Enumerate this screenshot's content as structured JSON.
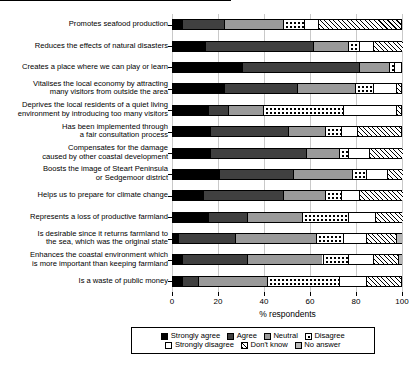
{
  "chart_data": {
    "type": "bar",
    "orientation": "horizontal",
    "stacked": true,
    "title": "",
    "xlabel": "% respondents",
    "ylabel": "",
    "xlim": [
      0,
      100
    ],
    "xticks": [
      0,
      20,
      40,
      60,
      80,
      100
    ],
    "grid": true,
    "legend_position": "bottom",
    "categories": [
      "Promotes seafood production",
      "Reduces the effects of natural disasters",
      "Creates a place where we can play or learn",
      "Vitalises the local economy by attracting\nmany visitors from outside the area",
      "Deprives the local residents of a quiet living\nenvironment by introducing too many visitors",
      "Has been implemented through\na fair consultation process",
      "Compensates for the damage\ncaused by other coastal development",
      "Boosts the image of Steart Peninsula\nor Sedgemoor district",
      "Helps us to prepare for climate change",
      "Represents a loss of productive farmland",
      "Is desirable since it returns farmland to\nthe sea, which was the original state",
      "Enhances the coastal environment which\nis more important than keeping farmland",
      "Is a waste of public money"
    ],
    "series": [
      {
        "name": "Strongly agree",
        "key": "strongly-agree",
        "values": [
          4,
          14,
          30,
          22,
          15,
          16,
          16,
          20,
          13,
          15,
          2,
          4,
          4
        ]
      },
      {
        "name": "Agree",
        "key": "agree",
        "values": [
          18,
          47,
          51,
          32,
          9,
          34,
          42,
          32,
          35,
          17,
          25,
          28,
          7
        ]
      },
      {
        "name": "Neutral",
        "key": "neutral",
        "values": [
          26,
          15,
          13,
          25,
          15,
          16,
          14,
          26,
          18,
          24,
          35,
          33,
          30
        ]
      },
      {
        "name": "Disagree",
        "key": "disagree",
        "values": [
          9,
          5,
          2,
          8,
          35,
          7,
          4,
          6,
          7,
          20,
          12,
          11,
          31
        ]
      },
      {
        "name": "Strongly disagree",
        "key": "strongly-disagree",
        "values": [
          6,
          6,
          3,
          10,
          23,
          7,
          9,
          9,
          8,
          12,
          10,
          11,
          12
        ]
      },
      {
        "name": "Don't know",
        "key": "dont-know",
        "values": [
          36,
          13,
          0,
          2,
          2,
          19,
          15,
          7,
          19,
          12,
          13,
          11,
          15
        ]
      },
      {
        "name": "No answer",
        "key": "no-answer",
        "values": [
          1,
          0,
          1,
          1,
          1,
          1,
          0,
          0,
          0,
          0,
          3,
          2,
          1
        ]
      }
    ]
  },
  "axis": {
    "x_title": "% respondents",
    "tick_labels": [
      "0",
      "20",
      "40",
      "60",
      "80",
      "100"
    ]
  },
  "legend": {
    "row1": [
      {
        "label": "Strongly agree",
        "key": "strongly-agree"
      },
      {
        "label": "Agree",
        "key": "agree"
      },
      {
        "label": "Neutral",
        "key": "neutral"
      },
      {
        "label": "Disagree",
        "key": "disagree"
      }
    ],
    "row2": [
      {
        "label": "Strongly disagree",
        "key": "strongly-disagree"
      },
      {
        "label": "Don't know",
        "key": "dont-know"
      },
      {
        "label": "No answer",
        "key": "no-answer"
      }
    ]
  },
  "colors": {
    "strongly_agree": "#000000",
    "agree": "#404040",
    "neutral": "#9a9a9a",
    "disagree": "#ffffff",
    "strongly_disagree": "#ffffff",
    "dont_know": "#ffffff",
    "no_answer": "#b8b8b8",
    "gridline": "#c9c9c9",
    "axis": "#000000"
  }
}
